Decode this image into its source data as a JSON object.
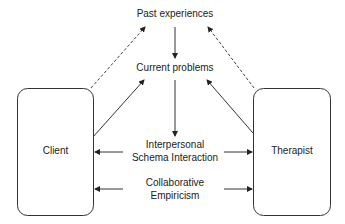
{
  "diagram": {
    "nodes": {
      "past": "Past experiences",
      "current": "Current problems",
      "interpersonal_1": "Interpersonal",
      "interpersonal_2": "Schema Interaction",
      "collab_1": "Collaborative",
      "collab_2": "Empiricism",
      "client": "Client",
      "therapist": "Therapist"
    },
    "edges": [
      {
        "from": "client",
        "to": "past",
        "style": "dashed"
      },
      {
        "from": "therapist",
        "to": "past",
        "style": "dashed"
      },
      {
        "from": "past",
        "to": "current",
        "style": "solid"
      },
      {
        "from": "client",
        "to": "current",
        "style": "solid"
      },
      {
        "from": "therapist",
        "to": "current",
        "style": "solid"
      },
      {
        "from": "current",
        "to": "interpersonal",
        "style": "solid"
      },
      {
        "from": "interpersonal",
        "to": "client",
        "style": "solid"
      },
      {
        "from": "interpersonal",
        "to": "therapist",
        "style": "solid"
      },
      {
        "from": "collaborative",
        "to": "client",
        "style": "solid"
      },
      {
        "from": "collaborative",
        "to": "therapist",
        "style": "solid"
      }
    ]
  }
}
